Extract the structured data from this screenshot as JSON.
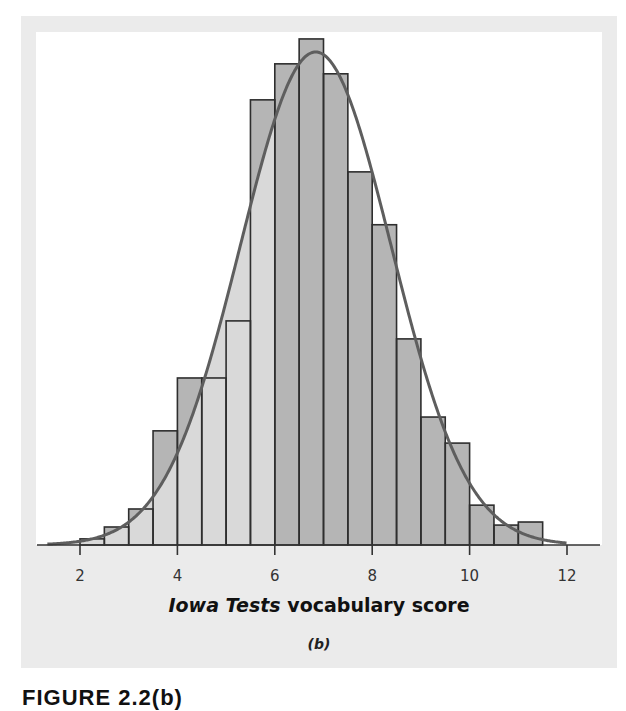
{
  "figure": {
    "xlabel_italic": "Iowa Tests",
    "xlabel_rest": " vocabulary score",
    "panel_label": "(b)",
    "caption": "FIGURE 2.2(b)"
  },
  "colors": {
    "panel_bg": "#ebebeb",
    "plot_bg": "#ffffff",
    "bar_fill": "#b5b5b5",
    "area_under_curve_fill": "#d9d9d9",
    "bar_stroke": "#2e2e2e",
    "curve": "#5e5e5e",
    "axis": "#333333"
  },
  "chart_data": {
    "type": "bar",
    "subtype": "histogram with fitted normal density curve",
    "title": "",
    "xlabel": "Iowa Tests vocabulary score",
    "ylabel": "",
    "panel_label": "(b)",
    "xlim": [
      1.3,
      12.5
    ],
    "xticks": [
      2,
      4,
      6,
      8,
      10,
      12
    ],
    "grid": false,
    "legend": null,
    "bin_width": 0.5,
    "bin_edges": [
      2,
      2.5,
      3,
      3.5,
      4,
      4.5,
      5,
      5.5,
      6,
      6.5,
      7,
      7.5,
      8,
      8.5,
      9,
      9.5,
      10,
      10.5,
      11,
      11.5
    ],
    "categories": [
      "2-2.5",
      "2.5-3",
      "3-3.5",
      "3.5-4",
      "4-4.5",
      "4.5-5",
      "5-5.5",
      "5.5-6",
      "6-6.5",
      "6.5-7",
      "7-7.5",
      "7.5-8",
      "8-8.5",
      "8.5-9",
      "9-9.5",
      "9.5-10",
      "10-10.5",
      "10.5-11",
      "11-11.5"
    ],
    "values": [
      0.16,
      0.47,
      0.94,
      2.98,
      4.36,
      4.36,
      5.85,
      11.62,
      12.56,
      13.21,
      12.3,
      9.74,
      8.36,
      5.38,
      3.34,
      2.66,
      1.04,
      0.52,
      0.6
    ],
    "values_unit": "approximate percent of scores per bin (no y-axis shown; estimated from bar heights relative to curve)",
    "normal_curve": {
      "mean": 6.84,
      "sd": 1.55
    },
    "shaded_region": {
      "description": "area under the normal curve to the left of 6",
      "from": 1.3,
      "to": 6
    }
  }
}
